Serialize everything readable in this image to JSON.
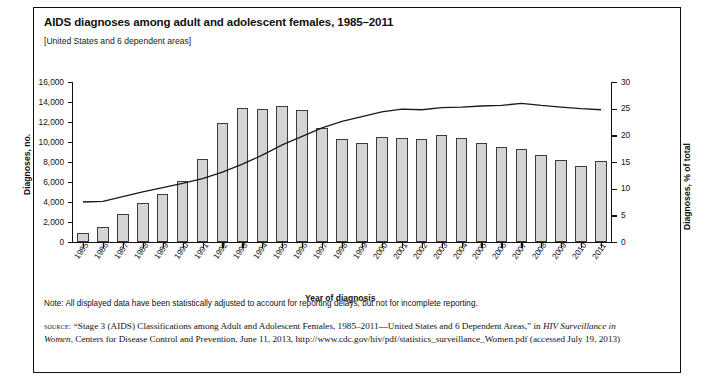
{
  "title": "AIDS diagnoses among adult and adolescent females, 1985–2011",
  "subtitle": "[United States and 6 dependent areas]",
  "note": "Note: All displayed data have been statistically adjusted to account for reporting delays, but not for incomplete reporting.",
  "source": {
    "label": "source:",
    "text_1": "“Stage 3 (AIDS) Classifications among Adult and Adolescent Females, 1985–2011—United States and 6 Dependent Areas,” in ",
    "italic_1": "HIV Surveillance in Women",
    "text_2": ", Centers for Disease Control and Prevention, June 11, 2013, http://www.cdc.gov/hiv/pdf/statistics_surveillance_Women.pdf (accessed July 19, 2013)"
  },
  "colors": {
    "bar_fill": "#d4d4d4",
    "bar_stroke": "#3b3b3b",
    "line": "#1a1a1a",
    "axis": "#111111"
  },
  "chart_data": {
    "type": "bar",
    "title": "AIDS diagnoses among adult and adolescent females, 1985–2011",
    "xlabel": "Year of diagnosis",
    "ylabel": "Diagnoses, no.",
    "y2label": "Diagnoses, % of total",
    "ylim": [
      0,
      16000
    ],
    "y2lim": [
      0,
      30
    ],
    "yticks": [
      "0",
      "2,000",
      "4,000",
      "6,000",
      "8,000",
      "10,000",
      "12,000",
      "14,000",
      "16,000"
    ],
    "y2ticks": [
      "0",
      "5",
      "10",
      "15",
      "20",
      "25",
      "30"
    ],
    "grid": false,
    "legend": "none",
    "categories": [
      "1985",
      "1986",
      "1987",
      "1988",
      "1989",
      "1990",
      "1991",
      "1992",
      "1993",
      "1994",
      "1995",
      "1996",
      "1997",
      "1998",
      "1999",
      "2000",
      "2001",
      "2002",
      "2003",
      "2004",
      "2005",
      "2006",
      "2007",
      "2008",
      "2009",
      "2010",
      "2011"
    ],
    "series": [
      {
        "name": "Diagnoses, no.",
        "type": "bar",
        "axis": "left",
        "values": [
          900,
          1500,
          2800,
          3900,
          4800,
          6100,
          8300,
          11900,
          13400,
          13300,
          13600,
          13200,
          11400,
          10300,
          9950,
          10500,
          10400,
          10350,
          10700,
          10450,
          9900,
          9550,
          9350,
          8700,
          8200,
          7600,
          8100
        ]
      },
      {
        "name": "Diagnoses, % of total",
        "type": "line",
        "axis": "right",
        "values": [
          7.5,
          7.6,
          8.5,
          9.4,
          10.2,
          11.0,
          11.9,
          13.1,
          14.6,
          16.3,
          18.2,
          19.8,
          21.4,
          22.6,
          23.5,
          24.4,
          24.9,
          24.8,
          25.2,
          25.3,
          25.5,
          25.6,
          26.0,
          25.6,
          25.3,
          25.0,
          24.8
        ]
      }
    ]
  }
}
